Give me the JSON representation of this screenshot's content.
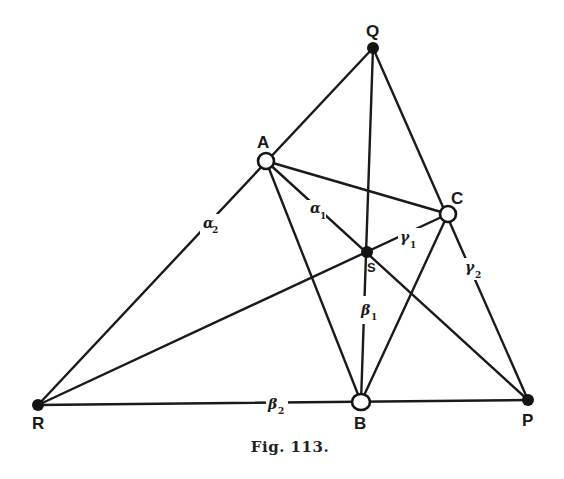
{
  "figure": {
    "caption": "Fig. 113.",
    "points": {
      "Q": {
        "label": "Q",
        "x": 373,
        "y": 48,
        "style": "filled"
      },
      "A": {
        "label": "A",
        "x": 266,
        "y": 161,
        "style": "open"
      },
      "C": {
        "label": "C",
        "x": 448,
        "y": 214,
        "style": "open"
      },
      "S": {
        "label": "S",
        "x": 367,
        "y": 252,
        "style": "filled"
      },
      "R": {
        "label": "R",
        "x": 38,
        "y": 405,
        "style": "filled"
      },
      "B": {
        "label": "B",
        "x": 361,
        "y": 402,
        "style": "open"
      },
      "P": {
        "label": "P",
        "x": 528,
        "y": 400,
        "style": "filled"
      }
    },
    "lines": [
      [
        "R",
        "Q"
      ],
      [
        "Q",
        "P"
      ],
      [
        "R",
        "P"
      ],
      [
        "Q",
        "B"
      ],
      [
        "A",
        "B"
      ],
      [
        "B",
        "C"
      ],
      [
        "A",
        "C"
      ],
      [
        "A",
        "P"
      ],
      [
        "R",
        "C"
      ]
    ],
    "segment_labels": {
      "alpha1": {
        "base": "α",
        "sub": "1"
      },
      "alpha2": {
        "base": "α",
        "sub": "2"
      },
      "beta1": {
        "base": "β",
        "sub": "1"
      },
      "beta2": {
        "base": "β",
        "sub": "2"
      },
      "gamma1": {
        "base": "γ",
        "sub": "1"
      },
      "gamma2": {
        "base": "γ",
        "sub": "2"
      }
    }
  }
}
